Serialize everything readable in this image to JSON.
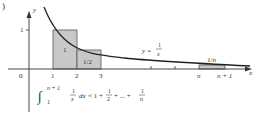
{
  "figure": {
    "corner_label": ")",
    "axes": {
      "x_label": "x",
      "y_label": "y",
      "origin_label": "0",
      "y_tick_label": "1",
      "x_tick_labels": [
        "1",
        "2",
        "3",
        "n",
        "n + 1"
      ]
    },
    "curve": {
      "label_prefix": "y =",
      "label_numerator": "1",
      "label_denominator": "x"
    },
    "rectangles": [
      {
        "from": "1",
        "to": "2",
        "height": "1",
        "label": "1"
      },
      {
        "from": "2",
        "to": "3",
        "height": "1/2",
        "label": "1/2"
      },
      {
        "from": "n",
        "to": "n + 1",
        "height": "1/n",
        "label": "1/n"
      }
    ],
    "inequality": {
      "upper_limit": "n + 1",
      "lower_limit": "1",
      "integrand_num": "1",
      "integrand_den": "x",
      "dx": "dx",
      "rhs_start": "< 1 +",
      "half_num": "1",
      "half_den": "2",
      "ellipsis": "+ ... +",
      "last_num": "1",
      "last_den": "n"
    },
    "colors": {
      "rect_fill": "#c8c8c8",
      "rect_stroke": "#555555",
      "curve": "#222222",
      "axis": "#333333"
    }
  }
}
